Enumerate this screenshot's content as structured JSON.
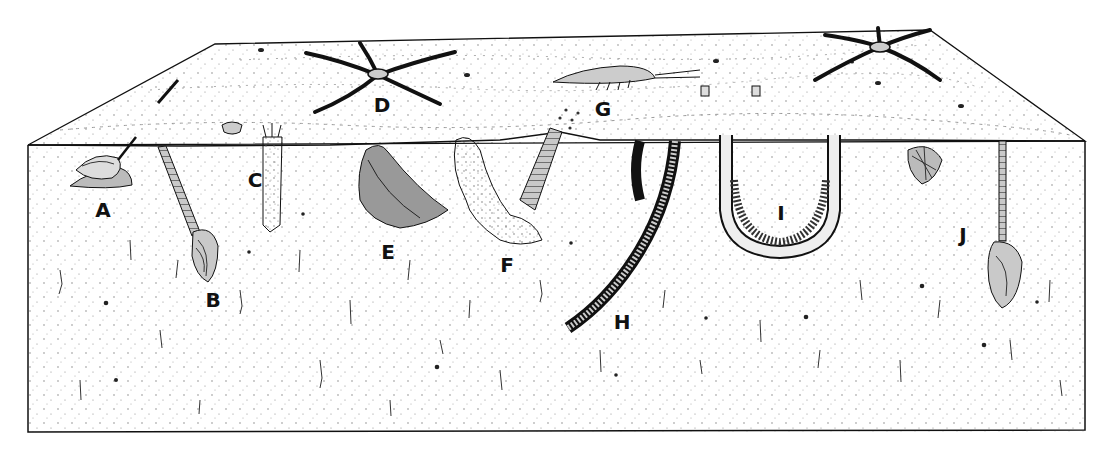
{
  "figure": {
    "type": "block-diagram",
    "colors": {
      "ink": "#111111",
      "paper": "#ffffff",
      "stipple": "#555555",
      "shade": "#bdbdbd"
    }
  },
  "labels": [
    {
      "id": "A",
      "text": "A",
      "x": 103,
      "y": 210
    },
    {
      "id": "B",
      "text": "B",
      "x": 213,
      "y": 300
    },
    {
      "id": "C",
      "text": "C",
      "x": 255,
      "y": 180
    },
    {
      "id": "D",
      "text": "D",
      "x": 382,
      "y": 105
    },
    {
      "id": "E",
      "text": "E",
      "x": 388,
      "y": 252
    },
    {
      "id": "F",
      "text": "F",
      "x": 507,
      "y": 265
    },
    {
      "id": "G",
      "text": "G",
      "x": 603,
      "y": 109
    },
    {
      "id": "H",
      "text": "H",
      "x": 622,
      "y": 322
    },
    {
      "id": "I",
      "text": "I",
      "x": 781,
      "y": 213
    },
    {
      "id": "J",
      "text": "J",
      "x": 963,
      "y": 235
    }
  ]
}
